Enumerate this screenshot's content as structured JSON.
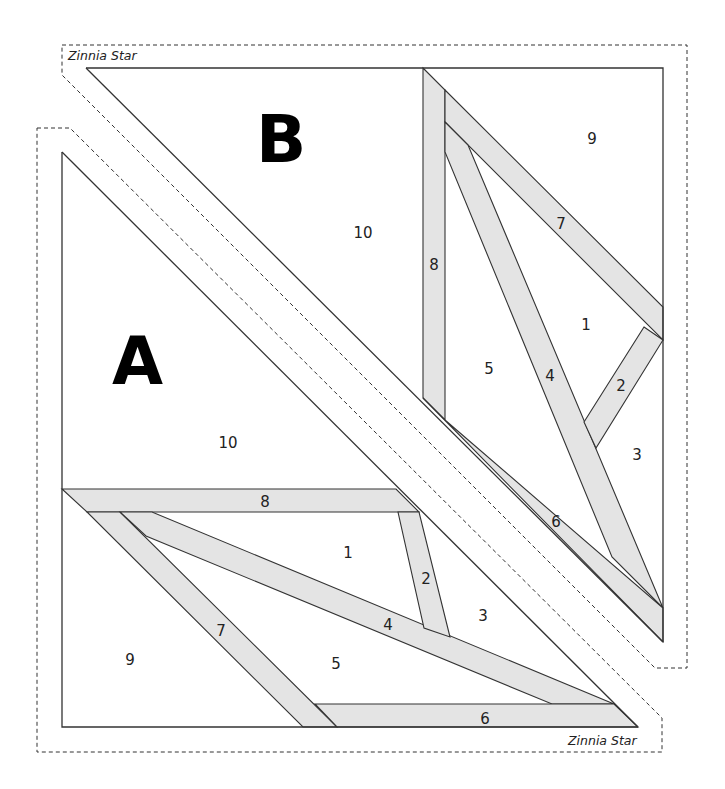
{
  "pattern": {
    "name": "Zinnia Star",
    "colors": {
      "strip_fill": "#e4e4e4",
      "line": "#333333",
      "background": "#ffffff"
    }
  },
  "block_b": {
    "letter": "B",
    "title": "Zinnia Star",
    "pieces": [
      {
        "num": "1",
        "x": 586,
        "y": 325
      },
      {
        "num": "2",
        "x": 621,
        "y": 386
      },
      {
        "num": "3",
        "x": 637,
        "y": 455
      },
      {
        "num": "4",
        "x": 550,
        "y": 376
      },
      {
        "num": "5",
        "x": 489,
        "y": 369
      },
      {
        "num": "6",
        "x": 556,
        "y": 522
      },
      {
        "num": "7",
        "x": 561,
        "y": 224
      },
      {
        "num": "8",
        "x": 434,
        "y": 265
      },
      {
        "num": "9",
        "x": 592,
        "y": 139
      },
      {
        "num": "10",
        "x": 363,
        "y": 233
      }
    ]
  },
  "block_a": {
    "letter": "A",
    "title": "Zinnia Star",
    "pieces": [
      {
        "num": "1",
        "x": 348,
        "y": 553
      },
      {
        "num": "2",
        "x": 426,
        "y": 579
      },
      {
        "num": "3",
        "x": 483,
        "y": 616
      },
      {
        "num": "4",
        "x": 388,
        "y": 625
      },
      {
        "num": "5",
        "x": 336,
        "y": 664
      },
      {
        "num": "6",
        "x": 485,
        "y": 719
      },
      {
        "num": "7",
        "x": 221,
        "y": 631
      },
      {
        "num": "8",
        "x": 265,
        "y": 502
      },
      {
        "num": "9",
        "x": 130,
        "y": 660
      },
      {
        "num": "10",
        "x": 228,
        "y": 443
      }
    ]
  }
}
